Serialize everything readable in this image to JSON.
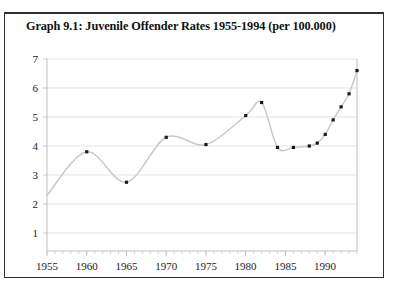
{
  "chart_data": {
    "type": "line",
    "title": "Graph 9.1: Juvenile Offender Rates 1955-1994 (per 100.000)",
    "xlabel": "",
    "ylabel": "",
    "grid": true,
    "legend": false,
    "xlim": [
      1955,
      1994
    ],
    "ylim": [
      0,
      7
    ],
    "yticks": [
      1,
      2,
      3,
      4,
      5,
      6,
      7
    ],
    "ytick_labels": [
      "1",
      "2",
      "3",
      "4",
      "5",
      "6",
      "7"
    ],
    "xticks": [
      1955,
      1960,
      1965,
      1970,
      1975,
      1980,
      1985,
      1990
    ],
    "xtick_labels": [
      "1955",
      "1960",
      "1965",
      "1970",
      "1975",
      "1980",
      "1985",
      "1990"
    ],
    "x_minor_tick_step": 1,
    "marker": "square",
    "marker_color": "#1a1a1a",
    "line_color": "#c9c9c9",
    "x": [
      1960,
      1965,
      1970,
      1975,
      1980,
      1982,
      1984,
      1986,
      1988,
      1989,
      1990,
      1991,
      1992,
      1993
    ],
    "values": [
      3.8,
      2.75,
      4.3,
      4.05,
      5.05,
      5.5,
      3.95,
      3.95,
      4.0,
      4.1,
      4.4,
      4.9,
      5.35,
      5.8
    ],
    "series": [
      {
        "name": "Juvenile Offender Rate",
        "points": [
          {
            "x": 1960,
            "y": 3.8
          },
          {
            "x": 1965,
            "y": 2.75
          },
          {
            "x": 1970,
            "y": 4.3
          },
          {
            "x": 1975,
            "y": 4.05
          },
          {
            "x": 1980,
            "y": 5.05
          },
          {
            "x": 1982,
            "y": 5.5
          },
          {
            "x": 1984,
            "y": 3.95
          },
          {
            "x": 1986,
            "y": 3.95
          },
          {
            "x": 1988,
            "y": 4.0
          },
          {
            "x": 1989,
            "y": 4.1
          },
          {
            "x": 1990,
            "y": 4.4
          },
          {
            "x": 1991,
            "y": 4.9
          },
          {
            "x": 1992,
            "y": 5.35
          },
          {
            "x": 1993,
            "y": 5.8
          },
          {
            "x": 1994,
            "y": 6.6
          }
        ]
      }
    ],
    "curve_start": {
      "x": 1955,
      "y": 2.3
    },
    "curve_end": {
      "x": 1994,
      "y": 6.6
    }
  }
}
